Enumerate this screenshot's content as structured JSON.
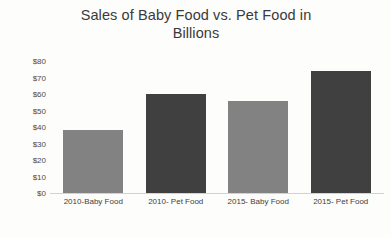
{
  "chart_data": {
    "type": "bar",
    "title": "Sales of Baby Food vs. Pet Food in Billions",
    "title_line1": "Sales of Baby Food vs. Pet Food in",
    "title_line2": "Billions",
    "xlabel": "",
    "ylabel": "",
    "categories": [
      "2010-Baby Food",
      "2010- Pet Food",
      "2015- Baby Food",
      "2015- Pet Food"
    ],
    "values": [
      38,
      60,
      56,
      74
    ],
    "ylim": [
      0,
      80
    ],
    "ytick_values": [
      0,
      10,
      20,
      30,
      40,
      50,
      60,
      70,
      80
    ],
    "ytick_labels": [
      "$0",
      "$10",
      "$20",
      "$30",
      "$40",
      "$50",
      "$60",
      "$70",
      "$80"
    ],
    "grid": false,
    "legend": false,
    "bar_colors": [
      "#828282",
      "#404040",
      "#828282",
      "#404040"
    ]
  },
  "colors": {
    "background": "#fdfdfc",
    "light_bar": "#828282",
    "dark_bar": "#404040",
    "axis_line": "#d2d2d2",
    "title_text": "#3a3a3a",
    "tick_text": "#4a4a4a"
  }
}
